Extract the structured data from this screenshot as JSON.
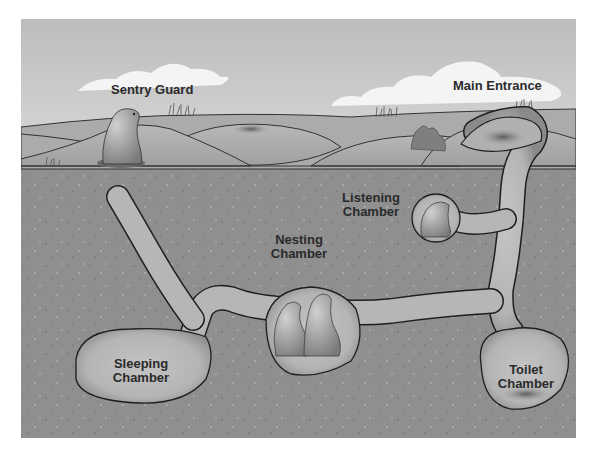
{
  "diagram": {
    "colors": {
      "background": "#ffffff",
      "sky_top": "#bdbdbd",
      "sky_bottom": "#d6d6d6",
      "mound_light": "#b4b4b4",
      "mound_dark": "#a2a2a2",
      "soil": "#8f8f8f",
      "tunnel": "#b9b9b9",
      "tunnel_edge": "#1e1e1e",
      "cloud": "#f2f2f2",
      "label_text": "#2a2a2a"
    },
    "labels": {
      "sentry_guard": "Sentry Guard",
      "main_entrance": "Main Entrance",
      "listening_chamber_line1": "Listening",
      "listening_chamber_line2": "Chamber",
      "nesting_chamber_line1": "Nesting",
      "nesting_chamber_line2": "Chamber",
      "sleeping_chamber_line1": "Sleeping",
      "sleeping_chamber_line2": "Chamber",
      "toilet_chamber_line1": "Toilet",
      "toilet_chamber_line2": "Chamber"
    },
    "nodes": [
      {
        "id": "sentry-guard",
        "label": "Sentry Guard",
        "location": "surface mound, left"
      },
      {
        "id": "main-entrance",
        "label": "Main Entrance",
        "location": "surface, right"
      },
      {
        "id": "listening-chamber",
        "label": "Listening Chamber",
        "location": "upper right, off main shaft"
      },
      {
        "id": "nesting-chamber",
        "label": "Nesting Chamber",
        "location": "center"
      },
      {
        "id": "sleeping-chamber",
        "label": "Sleeping Chamber",
        "location": "lower left"
      },
      {
        "id": "toilet-chamber",
        "label": "Toilet Chamber",
        "location": "lower right, bottom of main shaft"
      }
    ],
    "edges": [
      {
        "from": "main-entrance",
        "to": "toilet-chamber",
        "type": "vertical shaft"
      },
      {
        "from": "main-entrance",
        "to": "listening-chamber",
        "type": "side branch"
      },
      {
        "from": "toilet-chamber",
        "to": "nesting-chamber",
        "type": "tunnel"
      },
      {
        "from": "nesting-chamber",
        "to": "sleeping-chamber",
        "type": "tunnel"
      },
      {
        "from": "sleeping-chamber",
        "to": "dead-end-tunnel",
        "type": "tunnel branching upward-left"
      }
    ]
  }
}
